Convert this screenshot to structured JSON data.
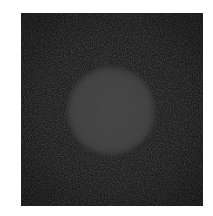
{
  "figure": {
    "kind": "grayscale-image",
    "canvas": {
      "width_px": 213,
      "height_px": 216,
      "background_color": "#ffffff"
    },
    "panel": {
      "name": "image-field",
      "x_px": 21,
      "y_px": 13,
      "width_px": 182,
      "height_px": 193,
      "fill_color": "#0d0d0d",
      "noise": "fine film grain",
      "noise_amplitude": "low"
    },
    "objects": [
      {
        "name": "circular-disc",
        "shape": "circle",
        "center_x_px": 111,
        "center_y_px": 111,
        "diameter_px": 90,
        "radius_px": 45,
        "fill_color": "#3a3a3a",
        "edge": "slightly soft / anti-aliased",
        "noise": "fine film grain",
        "noise_amplitude": "low"
      }
    ],
    "margins": {
      "left_px": 21,
      "top_px": 13,
      "right_px": 10,
      "bottom_px": 10
    },
    "palette": {
      "page_background": "#ffffff",
      "field_dark": "#0d0d0d",
      "disc_grey": "#3a3a3a"
    },
    "labels": {
      "title": "",
      "caption": "",
      "axis_ticks": [],
      "scale_bar": "",
      "annotations": []
    }
  }
}
